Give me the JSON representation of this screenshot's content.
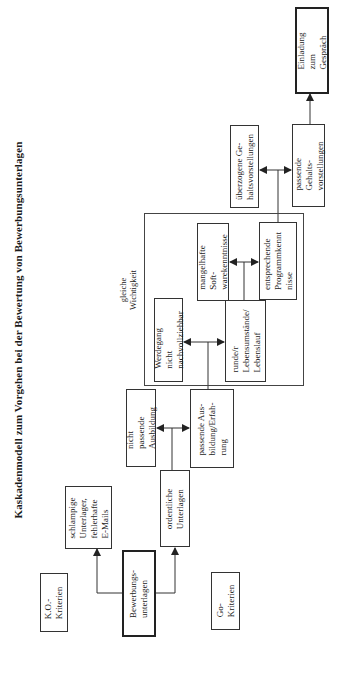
{
  "title": "Kaskadenmodell zum Vorgehen bei der Bewertung von Bewerbungsunterlagen",
  "colors": {
    "line": "#333333",
    "background": "#ffffff",
    "text": "#1a1a1a"
  },
  "nodes": {
    "ko_kriterien": "K.O.-\nKriterien",
    "go_kriterien": "Go-\nKriterien",
    "bewerbungsunterlagen": "Bewerbungs-\nunterlagen",
    "schlampige_unterlagen": "schlampige\nUnterlager,\nfehlerhafte\nE-Mails",
    "ordentliche_unterlagen": "ordentliche\nUnterlagen",
    "nicht_passende_ausbildung": "nicht passende\nAusbildung",
    "passende_ausbildung": "passende Aus-\nbildung/Erfah-\nrung",
    "werdegang": "Werdegang nicht\nnachvollziehbar",
    "runder_lebenslauf": "runde/r\nLebensumstände/\nLebenslauf",
    "mangelhafte_software": "mangelhafte Soft-\nwarekenntnisse",
    "entsprechende_programm": "entsprechende\nProgrammkennt\nnisse",
    "ueberzogene_gehalt": "überzogene Ge-\nhaltsvorstellungen",
    "passende_gehalt": "passende Gehalts-\nvorstellungen",
    "einladung": "Einladung zum\nGespräch"
  },
  "group_label": "gleiche\nWichtigkeit"
}
